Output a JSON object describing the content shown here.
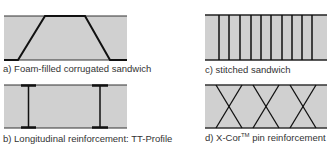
{
  "figure": {
    "panels": [
      {
        "id": "a",
        "caption": "a) Foam-filled corrugated sandwich",
        "type": "corrugated"
      },
      {
        "id": "b",
        "caption": "b) Longitudinal reinforcement: TT-Profile",
        "type": "tt-profile"
      },
      {
        "id": "c",
        "caption": "c) stitched sandwich",
        "type": "stitched"
      },
      {
        "id": "d",
        "caption_prefix": "d) X-Cor",
        "caption_sup": "TM",
        "caption_suffix": " pin reinforcement",
        "type": "x-cor"
      }
    ],
    "colors": {
      "foam_fill": "#d0d0d0",
      "line": "#1a1a1a"
    }
  }
}
